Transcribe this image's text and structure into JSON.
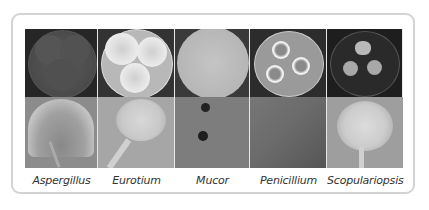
{
  "figure": {
    "columns": [
      {
        "label": "Aspergillus",
        "plate": "dark grey-green colonies, three lobes",
        "micro": "radiating conidial head"
      },
      {
        "label": "Eurotium",
        "plate": "white cottony colonies filling dish",
        "micro": "conidiophore with clustered conidia"
      },
      {
        "label": "Mucor",
        "plate": "uniform grey plate, confluent growth",
        "micro": "sparse dark sporangia"
      },
      {
        "label": "Penicillium",
        "plate": "three round white-rimmed colonies",
        "micro": "fine branched hyphae"
      },
      {
        "label": "Scopulariopsis",
        "plate": "three tan irregular colonies on dark dish",
        "micro": "branched conidiophores with chains"
      }
    ]
  },
  "colors": {
    "frame_border": "#d3d3d3",
    "label_text": "#333333",
    "plate_bg_dark": "#2a2a2a"
  }
}
